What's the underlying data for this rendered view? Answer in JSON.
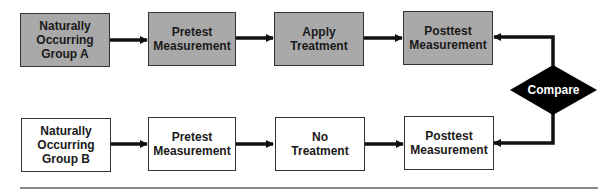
{
  "diagram": {
    "type": "flowchart",
    "title": "",
    "colors": {
      "treatment_group_fill": "#a9a9a9",
      "control_group_fill": "#ffffff",
      "compare_fill": "#000000",
      "border": "#333333"
    },
    "row_a": [
      {
        "id": "group-a",
        "label": "Naturally\nOccurring\nGroup A"
      },
      {
        "id": "pretest-a",
        "label": "Pretest\nMeasurement"
      },
      {
        "id": "treatment-a",
        "label": "Apply\nTreatment"
      },
      {
        "id": "posttest-a",
        "label": "Posttest\nMeasurement"
      }
    ],
    "row_b": [
      {
        "id": "group-b",
        "label": "Naturally\nOccurring\nGroup B"
      },
      {
        "id": "pretest-b",
        "label": "Pretest\nMeasurement"
      },
      {
        "id": "treatment-b",
        "label": "No\nTreatment"
      },
      {
        "id": "posttest-b",
        "label": "Posttest\nMeasurement"
      }
    ],
    "decision": {
      "id": "compare",
      "label": "Compare"
    },
    "edges": [
      [
        "group-a",
        "pretest-a"
      ],
      [
        "pretest-a",
        "treatment-a"
      ],
      [
        "treatment-a",
        "posttest-a"
      ],
      [
        "compare",
        "posttest-a"
      ],
      [
        "group-b",
        "pretest-b"
      ],
      [
        "pretest-b",
        "treatment-b"
      ],
      [
        "treatment-b",
        "posttest-b"
      ],
      [
        "compare",
        "posttest-b"
      ]
    ]
  }
}
